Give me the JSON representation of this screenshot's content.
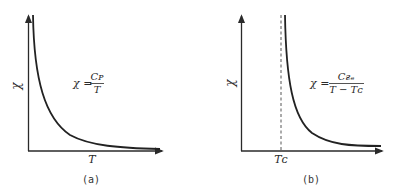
{
  "panels": [
    {
      "id": "a",
      "caption": "(a)",
      "y_axis_label": "χ",
      "x_axis_label": "T",
      "formula": {
        "lhs": "χ =",
        "numerator": "Cᴘ",
        "denominator": "T"
      },
      "curve": "hyperbola χ = C/T decaying toward T axis",
      "asymptote": null
    },
    {
      "id": "b",
      "caption": "(b)",
      "y_axis_label": "χ",
      "x_axis_label": "",
      "x_tick_label": "Tᴄ",
      "formula": {
        "lhs": "χ =",
        "numerator": "Cғₑ",
        "denominator": "T − Tᴄ"
      },
      "curve": "hyperbola χ = C/(T − Tc) diverging at Tc",
      "asymptote": "dashed vertical line at Tc"
    }
  ],
  "colors": {
    "ink": "#2a2a2a",
    "background": "#ffffff"
  }
}
